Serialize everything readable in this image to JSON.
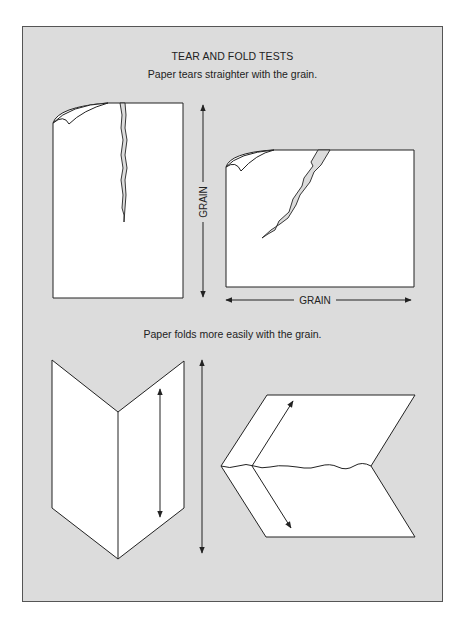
{
  "figure": {
    "title": "TEAR AND FOLD TESTS",
    "sections": [
      {
        "caption": "Paper tears straighter with the grain.",
        "diagrams": [
          {
            "name": "tear-with-grain",
            "grain_label": "GRAIN",
            "grain_direction": "vertical"
          },
          {
            "name": "tear-against-grain",
            "grain_label": "GRAIN",
            "grain_direction": "horizontal"
          }
        ]
      },
      {
        "caption": "Paper folds more easily with the grain.",
        "diagrams": [
          {
            "name": "fold-with-grain"
          },
          {
            "name": "fold-against-grain"
          }
        ]
      }
    ]
  },
  "colors": {
    "panel_bg": "#dcdcdc",
    "panel_border": "#555555",
    "paper": "#ffffff",
    "line": "#222222"
  }
}
